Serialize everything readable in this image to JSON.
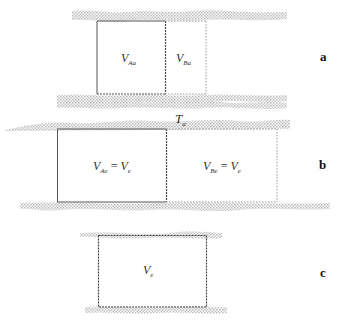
{
  "figure": {
    "panels": [
      {
        "id": "a",
        "letter": "a",
        "left_label": {
          "main": "V",
          "sub": "Aa"
        },
        "right_label": {
          "main": "V",
          "sub": "Ba"
        }
      },
      {
        "id": "b",
        "letter": "b",
        "top_label": {
          "main": "T",
          "sub": "a"
        },
        "left_label": {
          "main": "V",
          "sub": "Ae",
          "eq": " = ",
          "main2": "V",
          "sub2": "e"
        },
        "right_label": {
          "main": "V",
          "sub": "Be",
          "eq": " = ",
          "main2": "V",
          "sub2": "e"
        }
      },
      {
        "id": "c",
        "letter": "c",
        "center_label": {
          "main": "V",
          "sub": "e"
        }
      }
    ],
    "colors": {
      "solid_line": "#555555",
      "dashed_line": "#888888",
      "band_fill": "#c8c8c8"
    }
  }
}
